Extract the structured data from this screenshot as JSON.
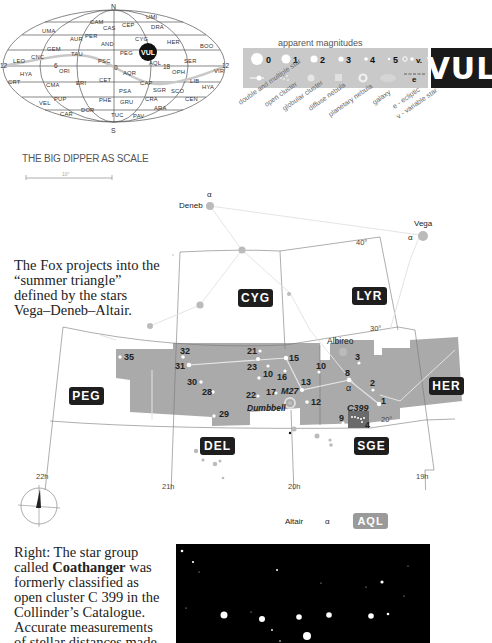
{
  "allsky_map": {
    "north_label": "N",
    "south_label": "S",
    "ra_labels": [
      "12",
      "6",
      "0",
      "18",
      "12"
    ],
    "highlight": "VUL",
    "constellations": [
      {
        "name": "UMI",
        "x": 146,
        "y": 19
      },
      {
        "name": "CAM",
        "x": 90,
        "y": 24
      },
      {
        "name": "CAS",
        "x": 103,
        "y": 30
      },
      {
        "name": "CEP",
        "x": 122,
        "y": 27
      },
      {
        "name": "DRA",
        "x": 151,
        "y": 29
      },
      {
        "name": "UMA",
        "x": 42,
        "y": 33
      },
      {
        "name": "AUR",
        "x": 70,
        "y": 41
      },
      {
        "name": "PER",
        "x": 85,
        "y": 38
      },
      {
        "name": "CYG",
        "x": 135,
        "y": 41
      },
      {
        "name": "HER",
        "x": 167,
        "y": 44
      },
      {
        "name": "BOO",
        "x": 200,
        "y": 48
      },
      {
        "name": "AND",
        "x": 101,
        "y": 46
      },
      {
        "name": "GEM",
        "x": 47,
        "y": 51
      },
      {
        "name": "TAU",
        "x": 71,
        "y": 56
      },
      {
        "name": "PEG",
        "x": 120,
        "y": 55
      },
      {
        "name": "LEO",
        "x": 13,
        "y": 63
      },
      {
        "name": "CNC",
        "x": 31,
        "y": 59
      },
      {
        "name": "PSC",
        "x": 98,
        "y": 63
      },
      {
        "name": "AQL",
        "x": 149,
        "y": 65
      },
      {
        "name": "SER",
        "x": 184,
        "y": 63
      },
      {
        "name": "HYA",
        "x": 20,
        "y": 76
      },
      {
        "name": "ORI",
        "x": 59,
        "y": 73
      },
      {
        "name": "AQR",
        "x": 123,
        "y": 75
      },
      {
        "name": "OPH",
        "x": 172,
        "y": 74
      },
      {
        "name": "VIR",
        "x": 214,
        "y": 73
      },
      {
        "name": "CRT",
        "x": 8,
        "y": 84
      },
      {
        "name": "CMA",
        "x": 46,
        "y": 87
      },
      {
        "name": "ERI",
        "x": 76,
        "y": 85
      },
      {
        "name": "CET",
        "x": 99,
        "y": 82
      },
      {
        "name": "CAP",
        "x": 140,
        "y": 85
      },
      {
        "name": "LIB",
        "x": 190,
        "y": 83
      },
      {
        "name": "HYA",
        "x": 202,
        "y": 89
      },
      {
        "name": "PSA",
        "x": 119,
        "y": 93
      },
      {
        "name": "SGR",
        "x": 153,
        "y": 92
      },
      {
        "name": "SCO",
        "x": 171,
        "y": 93
      },
      {
        "name": "VEL",
        "x": 39,
        "y": 105
      },
      {
        "name": "PUP",
        "x": 54,
        "y": 101
      },
      {
        "name": "PHE",
        "x": 99,
        "y": 102
      },
      {
        "name": "GRU",
        "x": 120,
        "y": 104
      },
      {
        "name": "CRA",
        "x": 145,
        "y": 101
      },
      {
        "name": "CEN",
        "x": 185,
        "y": 101
      },
      {
        "name": "CAR",
        "x": 60,
        "y": 116
      },
      {
        "name": "DOR",
        "x": 81,
        "y": 112
      },
      {
        "name": "ARA",
        "x": 154,
        "y": 110
      },
      {
        "name": "TUC",
        "x": 111,
        "y": 117
      },
      {
        "name": "PAV",
        "x": 133,
        "y": 118
      }
    ]
  },
  "legend": {
    "title": "apparent magnitudes",
    "magnitudes": [
      "0",
      "1",
      "2",
      "3",
      "4",
      "5",
      "v."
    ],
    "symbols": [
      {
        "name": "double and multiple star",
        "icon": "double-star-icon"
      },
      {
        "name": "open cluster",
        "icon": "open-cluster-icon"
      },
      {
        "name": "globular cluster",
        "icon": "globular-cluster-icon"
      },
      {
        "name": "diffuse nebula",
        "icon": "diffuse-nebula-icon"
      },
      {
        "name": "planetary nebula",
        "icon": "planetary-nebula-icon"
      },
      {
        "name": "galaxy",
        "icon": "galaxy-icon"
      },
      {
        "name": "e - ecliptic",
        "icon": "ecliptic-icon"
      },
      {
        "name": "v - variable star",
        "icon": "variable-star-icon"
      }
    ],
    "ecliptic_letter": "e",
    "badge": "VUL"
  },
  "scale": {
    "title": "THE BIG DIPPER AS SCALE",
    "value": "10°"
  },
  "captions": {
    "top": "The Fox projects into the “summer triangle” defined by the stars Vega–Deneb–Altair.",
    "bottom_prefix": "Right: The star group called ",
    "bottom_bold": "Coathanger",
    "bottom_rest": " was formerly classified as open cluster C 399 in the Collinder’s Catalogue. Accurate measurements of stellar distances made from HIPPARCOS"
  },
  "star_chart": {
    "constellation_labels": [
      {
        "name": "CYG",
        "x": 238,
        "y": 300,
        "dark": true
      },
      {
        "name": "LYR",
        "x": 354,
        "y": 296,
        "dark": true
      },
      {
        "name": "PEG",
        "x": 86,
        "y": 396,
        "dark": true
      },
      {
        "name": "HER",
        "x": 446,
        "y": 384,
        "dark": true
      },
      {
        "name": "DEL",
        "x": 221,
        "y": 445,
        "dark": true
      },
      {
        "name": "SGE",
        "x": 371,
        "y": 445,
        "dark": true
      },
      {
        "name": "AQL",
        "x": 370,
        "y": 519,
        "dark": false
      }
    ],
    "named_stars": [
      {
        "name": "Deneb",
        "greek": "α"
      },
      {
        "name": "Vega",
        "greek": "α"
      },
      {
        "name": "Altair",
        "greek": "α"
      },
      {
        "name": "Albireo"
      }
    ],
    "vul_alpha": "α",
    "star_numbers": [
      "1",
      "2",
      "3",
      "4",
      "8",
      "9",
      "10",
      "12",
      "13",
      "15",
      "16",
      "17",
      "18",
      "21",
      "22",
      "23",
      "28",
      "29",
      "30",
      "31",
      "32",
      "35"
    ],
    "objects": [
      {
        "name": "M27",
        "subtitle": "Dumbbell"
      },
      {
        "name": "C399"
      }
    ],
    "declinations": [
      "40°",
      "30°",
      "20°",
      "10°"
    ],
    "right_ascensions": [
      "22h",
      "21h",
      "20h",
      "19h"
    ]
  }
}
